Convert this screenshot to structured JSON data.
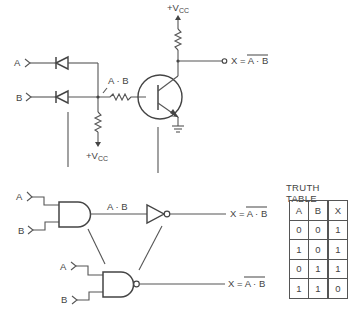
{
  "transistor_circuit": {
    "inputs": [
      {
        "label": "A"
      },
      {
        "label": "B"
      }
    ],
    "node_label": "A · B",
    "base_pullup_supply": {
      "sign": "+",
      "v": "V",
      "sub": "CC"
    },
    "collector_supply": {
      "sign": "+",
      "v": "V",
      "sub": "CC"
    },
    "output_label": {
      "prefix": "X = ",
      "expr": "A · B",
      "overbar": true
    }
  },
  "gate_equivalent": {
    "and_gate": {
      "inputs": [
        {
          "label": "A"
        },
        {
          "label": "B"
        }
      ],
      "output_label": "A · B"
    },
    "inverter_output_label": {
      "prefix": "X = ",
      "expr": "A · B",
      "overbar": true
    }
  },
  "nand_gate": {
    "inputs": [
      {
        "label": "A"
      },
      {
        "label": "B"
      }
    ],
    "output_label": {
      "prefix": "X = ",
      "expr": "A · B",
      "overbar": true
    }
  },
  "truth_table": {
    "title": "TRUTH TABLE",
    "headers": [
      "A",
      "B",
      "X"
    ],
    "rows": [
      [
        "0",
        "0",
        "1"
      ],
      [
        "1",
        "0",
        "1"
      ],
      [
        "0",
        "1",
        "1"
      ],
      [
        "1",
        "1",
        "0"
      ]
    ]
  },
  "colors": {
    "line": "#555555",
    "text": "#444444",
    "background": "#ffffff"
  }
}
